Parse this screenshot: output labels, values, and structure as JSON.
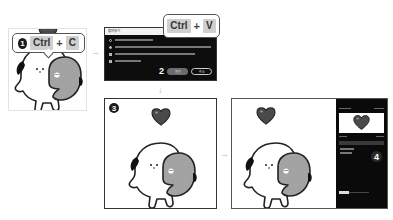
{
  "step1": {
    "badge": "1",
    "key1": "Ctrl",
    "plus": "+",
    "key2": "C"
  },
  "step2": {
    "callout": {
      "key1": "Ctrl",
      "plus": "+",
      "key2": "V"
    },
    "dialog": {
      "title": "붙여넣기",
      "options": [
        {
          "type": "radio",
          "selected": false
        },
        {
          "type": "radio",
          "selected": true
        },
        {
          "type": "checkbox",
          "selected": true
        },
        {
          "type": "checkbox",
          "selected": true
        }
      ],
      "badge": "2",
      "ok_label": "확인",
      "cancel_label": "취소"
    }
  },
  "step3": {
    "badge": "3"
  },
  "step4": {
    "badge": "4"
  },
  "arrows": {
    "right": "→",
    "down": "↓"
  },
  "colors": {
    "heart": "#4a4a4a",
    "gray_char": "#9a9a9a",
    "dialog_bg": "#0d0d0d",
    "panel_bg": "#0a0a0a"
  }
}
